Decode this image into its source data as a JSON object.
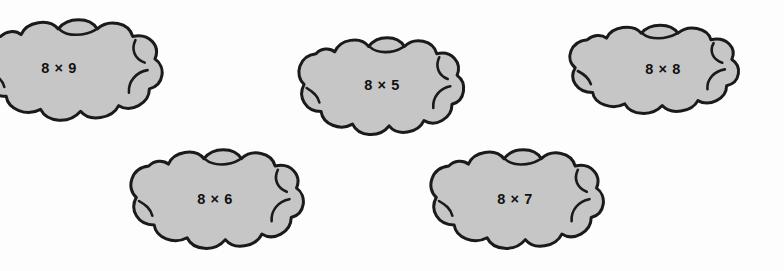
{
  "page": {
    "background_color": "#fdfdfd"
  },
  "style": {
    "cloud_fill": "#c6c6c6",
    "cloud_outline": "#1a1a1a",
    "text_color": "#111111"
  },
  "clouds": [
    {
      "id": "cloud-8x9",
      "label": "8 × 9",
      "factor_a": "8",
      "operator": "×",
      "factor_b": "9",
      "position": {
        "left": -18,
        "top": 14,
        "width": 186,
        "height": 116
      }
    },
    {
      "id": "cloud-8x5",
      "label": "8 × 5",
      "factor_a": "8",
      "operator": "×",
      "factor_b": "5",
      "position": {
        "left": 299,
        "top": 32,
        "width": 170,
        "height": 112
      }
    },
    {
      "id": "cloud-8x8",
      "label": "8 × 8",
      "factor_a": "8",
      "operator": "×",
      "factor_b": "8",
      "position": {
        "left": 570,
        "top": 20,
        "width": 174,
        "height": 102
      }
    },
    {
      "id": "cloud-8x6",
      "label": "8 × 6",
      "factor_a": "8",
      "operator": "×",
      "factor_b": "6",
      "position": {
        "left": 131,
        "top": 144,
        "width": 178,
        "height": 114
      }
    },
    {
      "id": "cloud-8x7",
      "label": "8 × 7",
      "factor_a": "8",
      "operator": "×",
      "factor_b": "7",
      "position": {
        "left": 431,
        "top": 144,
        "width": 178,
        "height": 114
      }
    }
  ]
}
